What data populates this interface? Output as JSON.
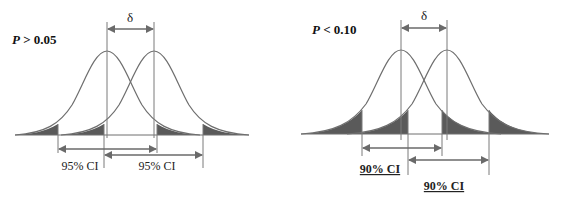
{
  "panels": [
    {
      "id": "left",
      "title": "P > 0.05",
      "title_italic_part": "P",
      "title_rest": " > 0.05",
      "delta_label": "δ",
      "ci_labels": [
        "95% CI",
        "95% CI"
      ],
      "ci_underlined": false,
      "ci_level": "95%"
    },
    {
      "id": "right",
      "title": "P < 0.10",
      "title_italic_part": "P",
      "title_rest": " < 0.10",
      "delta_label": "δ",
      "ci_labels": [
        "90% CI",
        "90% CI"
      ],
      "ci_underlined": true,
      "ci_level": "90%"
    }
  ],
  "colors": {
    "curve": "#6e6e6e",
    "shade": "#5a5a5a",
    "arrow": "#6a6a6a",
    "text": "#111111",
    "background": "#ffffff"
  }
}
